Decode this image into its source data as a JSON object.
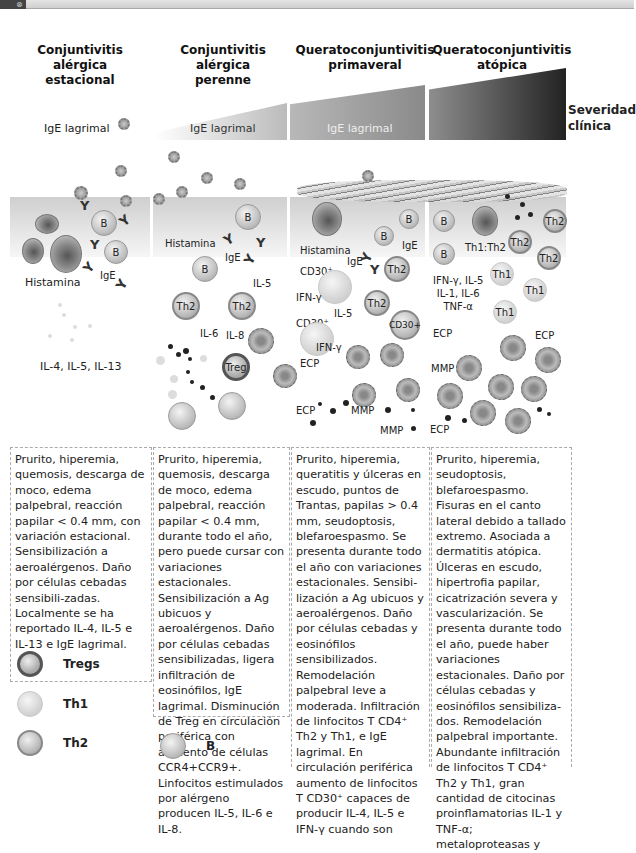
{
  "columns": [
    {
      "title": [
        "Conjuntivitis",
        "alérgica",
        "estacional"
      ],
      "ige_label": "IgE lagrimal"
    },
    {
      "title": [
        "Conjuntivitis",
        "alérgica",
        "perenne"
      ],
      "ige_label": "IgE lagrimal"
    },
    {
      "title": [
        "Queratoconjuntivitis",
        "primaveral"
      ],
      "ige_label": "IgE lagrimal"
    },
    {
      "title": [
        "Queratoconjuntivitis",
        "atópica"
      ],
      "ige_label": ""
    }
  ],
  "severity_label": [
    "Severidad",
    "clínica"
  ],
  "diagram_labels": {
    "col1": {
      "histamina": "Histamina",
      "ige": "IgE",
      "cytokines": "IL-4, IL-5, IL-13",
      "b": "B"
    },
    "col2": {
      "histamina": "Histamina",
      "ige": "IgE",
      "il5": "IL-5",
      "il6": "IL-6",
      "il8": "IL-8",
      "th2": "Th2",
      "treg": "Treg",
      "b": "B"
    },
    "col3": {
      "histamina": "Histamina",
      "ige1": "IgE",
      "ige2": "IgE",
      "cd30a": "CD30⁺",
      "cd30b": "CD30⁺",
      "cd30c": "CD30+",
      "ifn1": "IFN-γ",
      "ifn2": "IFN-γ",
      "il5": "IL-5",
      "ecp1": "ECP",
      "ecp2": "ECP",
      "mmp1": "MMP",
      "mmp2": "MMP",
      "th2": "Th2",
      "b": "B"
    },
    "col4": {
      "th1th2": "Th1:Th2",
      "cytokines": [
        "IFN-γ, IL-5",
        "IL-1, IL-6",
        "TNF-α"
      ],
      "ecp1": "ECP",
      "ecp2": "ECP",
      "ecp3": "ECP",
      "mmp": "MMP",
      "th1": "Th1",
      "th2": "Th2",
      "b": "B"
    }
  },
  "descriptions": [
    "Prurito, hiperemia, quemosis, descarga de moco, edema palpebral, reacción papilar < 0.4 mm, con variación estacional. Sensibilización a aeroalérgenos. Daño por células cebadas sensibili-zadas.  Localmente se ha reportado IL-4, IL-5 e IL-13 e IgE lagrimal.",
    "Prurito, hiperemia, quemosis, descarga de moco, edema palpebral, reacción papilar < 0.4 mm, durante todo el año, pero puede cursar con variaciones estacionales. Sensibilización a Ag ubicuos y aeroalérgenos. Daño por células cebadas sensibilizadas, ligera infiltración de eosinófilos, IgE lagrimal.  Disminución de Treg en circulación periférica con aumento de células CCR4+CCR9+. Linfocitos estimulados por alérgeno producen IL-5, IL-6 e IL-8.",
    "Prurito, hiperemia, queratitis y úlceras en escudo, puntos de Trantas, papilas > 0.4 mm, seudoptosis, blefaroespasmo. Se presenta durante todo el año con variaciones estacionales. Sensibi-lización a Ag ubicuos y aeroalérgenos. Daño por células cebadas y eosinófilos  sensibilizados. Remodelación palpebral leve a moderada. Infiltración de linfocitos T CD4⁺ Th2 y Th1, e IgE lagrimal. En circulación periférica aumento de linfocitos T CD30⁺ capaces de producir IL-4, IL-5 e IFN-γ cuando son",
    "Prurito, hiperemia, seudoptosis, blefaroespasmo. Fisuras en el canto lateral debido a tallado extremo. Asociada a dermatitis atópica. Úlceras en escudo, hipertrofia papilar, cicatrización severa y vascularización. Se presenta durante todo el año, puede haber variaciones estacionales. Daño por células cebadas y eosinófilos sensibiliza-dos. Remodelación palpebral importante. Abundante infiltración de linfocitos T CD4⁺ Th2 y Th1, gran cantidad de citocinas proinflamatorias IL-1 y TNF-α;  metaloproteasas y"
  ],
  "legend": [
    {
      "label": "Tregs",
      "icon": "treg-cell-icon"
    },
    {
      "label": "Th1",
      "icon": "th1-cell-icon"
    },
    {
      "label": "Th2",
      "icon": "th2-cell-icon"
    },
    {
      "label": "B",
      "icon": "b-cell-icon"
    }
  ]
}
